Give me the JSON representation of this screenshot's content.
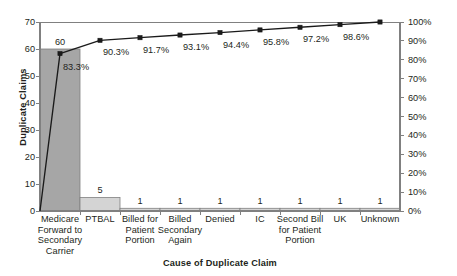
{
  "chart_data": {
    "type": "bar",
    "title": "",
    "subtitle": "",
    "xlabel": "Cause of Duplicate Claim",
    "ylabel": "Duplicate Claims",
    "y2label": "",
    "categories": [
      "Medicare Forward to Secondary Carrier",
      "PTBAL",
      "Billed for Patient Portion",
      "Billed Secondary Again",
      "Denied",
      "IC",
      "Second Bill for Patient Portion",
      "UK",
      "Unknown"
    ],
    "category_lines": [
      [
        "Medicare",
        "Forward to",
        "Secondary",
        "Carrier"
      ],
      [
        "PTBAL"
      ],
      [
        "Billed for",
        "Patient",
        "Portion"
      ],
      [
        "Billed",
        "Secondary",
        "Again"
      ],
      [
        "Denied"
      ],
      [
        "IC"
      ],
      [
        "Second Bill",
        "for Patient",
        "Portion"
      ],
      [
        "UK"
      ],
      [
        "Unknown"
      ]
    ],
    "series": [
      {
        "name": "Duplicate Claims",
        "type": "bar",
        "axis": "left",
        "values": [
          60,
          5,
          1,
          1,
          1,
          1,
          1,
          1,
          1
        ],
        "labels": [
          "60",
          "5",
          "1",
          "1",
          "1",
          "1",
          "1",
          "1",
          "1"
        ]
      },
      {
        "name": "Cumulative Percentage",
        "type": "line",
        "axis": "right",
        "values": [
          83.3,
          90.3,
          91.7,
          93.1,
          94.4,
          95.8,
          97.2,
          98.6,
          100
        ],
        "labels": [
          "83.3%",
          "90.3%",
          "91.7%",
          "93.1%",
          "94.4%",
          "95.8%",
          "97.2%",
          "98.6%",
          ""
        ]
      }
    ],
    "total": 72,
    "ylim": [
      0,
      70
    ],
    "yticks": [
      0,
      10,
      20,
      30,
      40,
      50,
      60,
      70
    ],
    "ytick_labels": [
      "0",
      "10",
      "20",
      "30",
      "40",
      "50",
      "60",
      "70"
    ],
    "y2lim": [
      0,
      100
    ],
    "y2ticks": [
      0,
      10,
      20,
      30,
      40,
      50,
      60,
      70,
      80,
      90,
      100
    ],
    "y2tick_labels": [
      "0%",
      "10%",
      "20%",
      "30%",
      "40%",
      "50%",
      "60%",
      "70%",
      "80%",
      "90%",
      "100%"
    ],
    "grid": false,
    "legend": "none",
    "colors": {
      "bar_first": "#a6a6a6",
      "bar_rest": "#d4d4d4",
      "bar_edge": "#808080",
      "line": "#1a1a1a",
      "marker": "#1a1a1a",
      "axis": "#808080",
      "text": "#231f20",
      "background": "#ffffff"
    }
  }
}
